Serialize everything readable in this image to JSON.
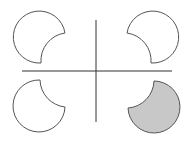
{
  "diagram": {
    "colors": {
      "stroke": "#555555",
      "axis": "#333333",
      "fill_unshaded": "#ffffff",
      "fill_shaded": "#c8c8c8"
    },
    "axes": {
      "horizontal": {
        "x1": 22,
        "y1": 71,
        "x2": 172,
        "y2": 71
      },
      "vertical": {
        "x1": 96,
        "y1": 20,
        "x2": 96,
        "y2": 122
      }
    },
    "shapes": [
      {
        "quadrant": "top-left",
        "shaded": false
      },
      {
        "quadrant": "top-right",
        "shaded": false
      },
      {
        "quadrant": "bottom-left",
        "shaded": false
      },
      {
        "quadrant": "bottom-right",
        "shaded": true
      }
    ]
  }
}
